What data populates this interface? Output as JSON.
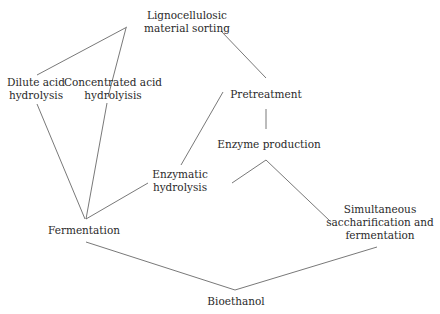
{
  "diagram": {
    "type": "process-flow",
    "nodes": [
      {
        "id": "ligno",
        "lines": [
          "Lignocellulosic",
          "material sorting"
        ]
      },
      {
        "id": "dilute",
        "lines": [
          "Dilute acid",
          "hydrolysis"
        ]
      },
      {
        "id": "conc",
        "lines": [
          "Concentrated acid",
          "hydrolyisis"
        ]
      },
      {
        "id": "pretreat",
        "lines": [
          "Pretreatment"
        ]
      },
      {
        "id": "enzprod",
        "lines": [
          "Enzyme production"
        ]
      },
      {
        "id": "enzhyd",
        "lines": [
          "Enzymatic",
          "hydrolysis"
        ]
      },
      {
        "id": "ferm",
        "lines": [
          "Fermentation"
        ]
      },
      {
        "id": "ssf",
        "lines": [
          "Simultaneous",
          "saccharification and",
          "fermentation"
        ]
      },
      {
        "id": "bioeth",
        "lines": [
          "Bioethanol"
        ]
      }
    ],
    "edges": [
      [
        "ligno",
        "dilute"
      ],
      [
        "ligno",
        "conc"
      ],
      [
        "ligno",
        "pretreat"
      ],
      [
        "dilute",
        "ferm"
      ],
      [
        "conc",
        "ferm"
      ],
      [
        "pretreat",
        "enzprod"
      ],
      [
        "pretreat",
        "enzhyd"
      ],
      [
        "enzhyd",
        "ferm"
      ],
      [
        "enzhyd",
        "ssf"
      ],
      [
        "enzprod",
        "ssf"
      ],
      [
        "ferm",
        "bioeth"
      ],
      [
        "ssf",
        "bioeth"
      ]
    ],
    "line_color": "#555555",
    "text_color": "#2a2a2a"
  }
}
